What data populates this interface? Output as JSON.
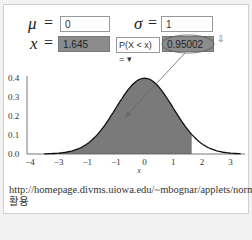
{
  "controls": {
    "mu_label": "μ",
    "sigma_label": "σ",
    "x_label": "x",
    "equals": "=",
    "mu_value": "0",
    "sigma_value": "1",
    "x_value": "1.645",
    "prob_select": "P(X < x) = ▾",
    "prob_value": "0.95002",
    "cursor_icon": "⇩"
  },
  "caption": "http://homepage.divms.uiowa.edu/~mbognar/applets/normal.html 활용",
  "chart_data": {
    "type": "area",
    "xlabel": "x",
    "ylabel": "",
    "xlim": [
      -4,
      3.4
    ],
    "ylim": [
      0,
      0.4
    ],
    "x_tick_labels": [
      "−4",
      "−3",
      "−1",
      "−1",
      "0",
      "1",
      "2",
      "3"
    ],
    "y_tick_labels": [
      "0.0",
      "0.1",
      "0.2",
      "0.3",
      "0.4"
    ],
    "mean": 0,
    "sd": 1,
    "shaded_region": {
      "from": -4,
      "to": 1.645,
      "probability": 0.95002
    },
    "grid": false,
    "annotation": "arrow from probability value 0.95002 to shaded area"
  }
}
